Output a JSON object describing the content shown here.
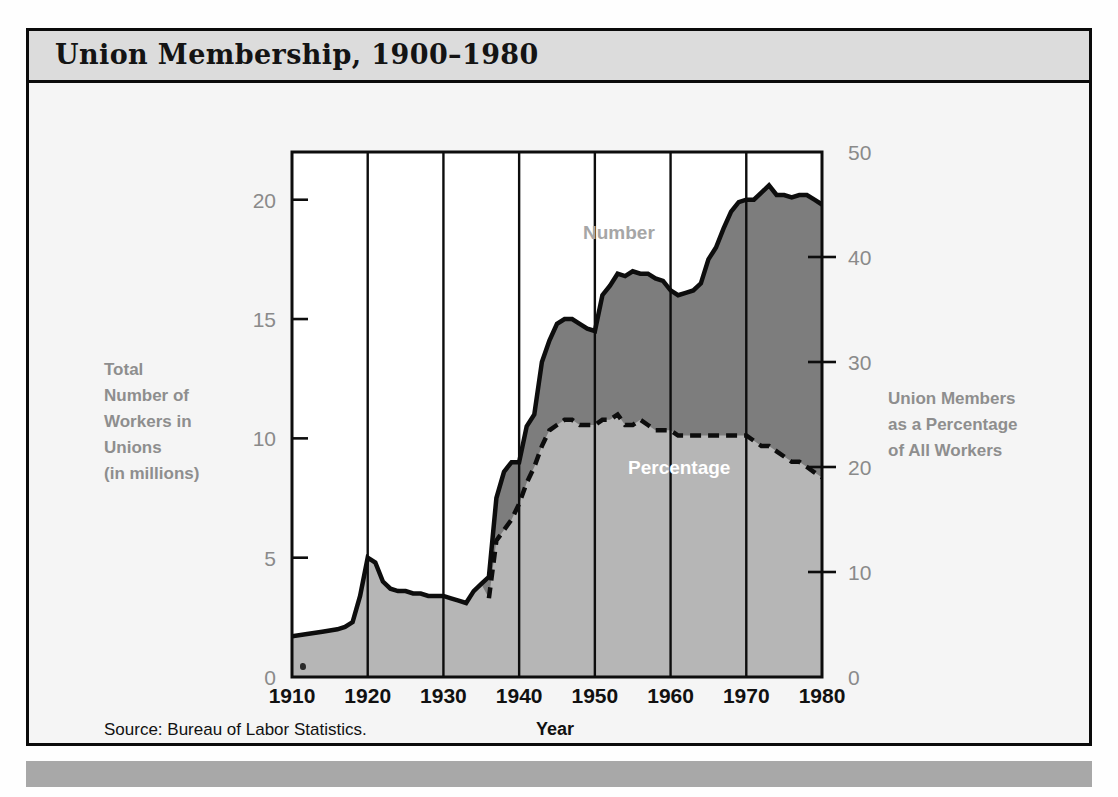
{
  "title": "Union Membership,  1900–1980",
  "source_note": "Source: Bureau of Labor Statistics.",
  "left_axis_label": "Total\nNumber of\nWorkers in\nUnions\n(in millions)",
  "right_axis_label": "Union Members\nas a Percentage\nof All Workers",
  "x_axis_title": "Year",
  "series_labels": {
    "number": "Number",
    "percentage": "Percentage"
  },
  "colors": {
    "banner_bg": "#dcdcdc",
    "page_bg": "#f5f5f5",
    "frame": "#0b0b0b",
    "footer_band": "#a8a8a8",
    "number_area": "#7d7d7d",
    "percentage_area": "#b6b6b6",
    "axis_text": "#8a8a8a",
    "label_text": "#8e8e8e",
    "pct_label_text": "#ffffff"
  },
  "chart_data": {
    "type": "area",
    "title": "Union Membership,  1900–1980",
    "xlabel": "Year",
    "ylabel": "Total Number of Workers in Unions (in millions)",
    "y2label": "Union Members as a Percentage of All Workers",
    "xlim": [
      1910,
      1980
    ],
    "ylim": [
      0,
      22
    ],
    "y2lim": [
      0,
      50
    ],
    "xticks": [
      1910,
      1920,
      1930,
      1940,
      1950,
      1960,
      1970,
      1980
    ],
    "yticks": [
      0,
      5,
      10,
      15,
      20
    ],
    "y2ticks": [
      0,
      10,
      20,
      30,
      40,
      50
    ],
    "grid": "vertical-gridlines-at-each-decade",
    "legend": "inline-labels",
    "series": [
      {
        "name": "Number",
        "unit": "millions of workers",
        "axis": "left",
        "x": [
          1910,
          1912,
          1914,
          1916,
          1917,
          1918,
          1919,
          1920,
          1921,
          1922,
          1923,
          1924,
          1925,
          1926,
          1927,
          1928,
          1929,
          1930,
          1931,
          1932,
          1933,
          1934,
          1935,
          1936,
          1937,
          1938,
          1939,
          1940,
          1941,
          1942,
          1943,
          1944,
          1945,
          1946,
          1947,
          1948,
          1949,
          1950,
          1951,
          1952,
          1953,
          1954,
          1955,
          1956,
          1957,
          1958,
          1959,
          1960,
          1961,
          1962,
          1963,
          1964,
          1965,
          1966,
          1967,
          1968,
          1969,
          1970,
          1971,
          1972,
          1973,
          1974,
          1975,
          1976,
          1977,
          1978,
          1979,
          1980
        ],
        "y": [
          1.7,
          1.8,
          1.9,
          2.0,
          2.1,
          2.3,
          3.4,
          5.0,
          4.8,
          4.0,
          3.7,
          3.6,
          3.6,
          3.5,
          3.5,
          3.4,
          3.4,
          3.4,
          3.3,
          3.2,
          3.1,
          3.6,
          3.9,
          4.2,
          7.5,
          8.6,
          9.0,
          9.0,
          10.5,
          11.0,
          13.2,
          14.1,
          14.8,
          15.0,
          15.0,
          14.8,
          14.6,
          14.5,
          16.0,
          16.4,
          16.9,
          16.8,
          17.0,
          16.9,
          16.9,
          16.7,
          16.6,
          16.2,
          16.0,
          16.1,
          16.2,
          16.5,
          17.5,
          18.0,
          18.8,
          19.5,
          19.9,
          20.0,
          20.0,
          20.3,
          20.6,
          20.2,
          20.2,
          20.1,
          20.2,
          20.2,
          20.0,
          19.8
        ]
      },
      {
        "name": "Percentage",
        "unit": "percent of all workers",
        "axis": "right",
        "note": "dashed line, begins 1936",
        "x": [
          1936,
          1937,
          1938,
          1939,
          1940,
          1941,
          1942,
          1943,
          1944,
          1945,
          1946,
          1947,
          1948,
          1949,
          1950,
          1951,
          1952,
          1953,
          1954,
          1955,
          1956,
          1957,
          1958,
          1959,
          1960,
          1961,
          1962,
          1963,
          1964,
          1965,
          1966,
          1967,
          1968,
          1969,
          1970,
          1971,
          1972,
          1973,
          1974,
          1975,
          1976,
          1977,
          1978,
          1979,
          1980
        ],
        "y": [
          7.5,
          13.0,
          14.0,
          15.0,
          16.5,
          18.5,
          20.0,
          22.0,
          23.5,
          24.0,
          24.5,
          24.5,
          24.0,
          24.0,
          24.0,
          24.5,
          24.5,
          25.0,
          24.0,
          24.0,
          24.5,
          24.0,
          23.5,
          23.5,
          23.5,
          23.0,
          23.0,
          23.0,
          23.0,
          23.0,
          23.0,
          23.0,
          23.0,
          23.0,
          23.0,
          22.5,
          22.0,
          22.0,
          21.5,
          21.0,
          20.5,
          20.5,
          20.0,
          19.5,
          19.0
        ]
      }
    ]
  }
}
